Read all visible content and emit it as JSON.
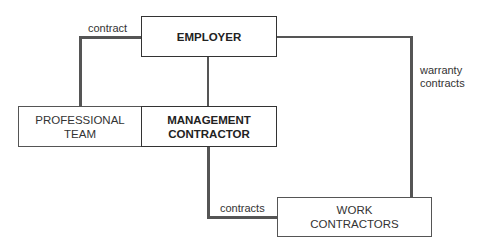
{
  "diagram": {
    "nodes": {
      "employer": {
        "lines": [
          "EMPLOYER"
        ]
      },
      "professional_team": {
        "lines": [
          "PROFESSIONAL",
          "TEAM"
        ]
      },
      "management_contractor": {
        "lines": [
          "MANAGEMENT",
          "CONTRACTOR"
        ]
      },
      "work_contractors": {
        "lines": [
          "WORK",
          "CONTRACTORS"
        ]
      }
    },
    "edge_labels": {
      "contract": "contract",
      "warranty": [
        "warranty",
        "contracts"
      ],
      "contracts": "contracts"
    },
    "edges": [
      {
        "from": "employer",
        "to": "professional_team",
        "label": "contract"
      },
      {
        "from": "employer",
        "to": "management_contractor",
        "label": ""
      },
      {
        "from": "employer",
        "to": "work_contractors",
        "label": "warranty contracts"
      },
      {
        "from": "management_contractor",
        "to": "work_contractors",
        "label": "contracts"
      }
    ]
  }
}
